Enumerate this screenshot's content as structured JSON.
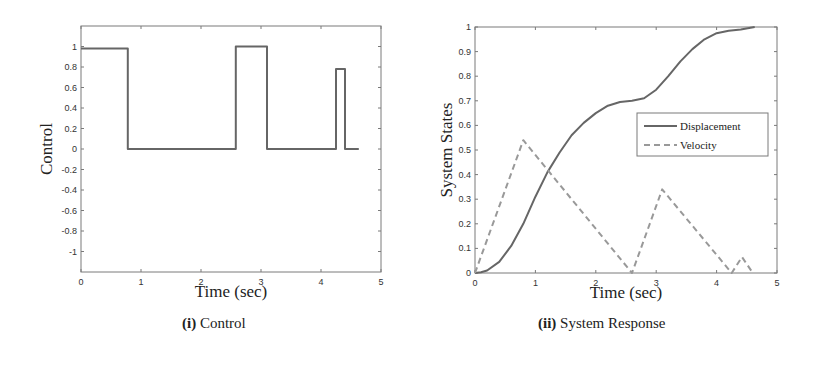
{
  "chart_data": [
    {
      "type": "line",
      "title": "",
      "caption_prefix": "(i)",
      "caption": "Control",
      "xlabel": "Time (sec)",
      "ylabel": "Control",
      "xlim": [
        0,
        5
      ],
      "ylim": [
        -1.2,
        1.2
      ],
      "xticks": [
        "0",
        "1",
        "2",
        "3",
        "4",
        "5"
      ],
      "yticks": [
        "1",
        "0.8",
        "0.6",
        "0.4",
        "0.2",
        "0",
        "-0.2",
        "-0.4",
        "-0.6",
        "-0.8",
        "-1"
      ],
      "grid": false,
      "series": [
        {
          "name": "Control",
          "style": "solid",
          "color": "#666666",
          "x": [
            0,
            0.78,
            0.78,
            2.58,
            2.58,
            3.1,
            3.1,
            4.25,
            4.25,
            4.4,
            4.4,
            4.63
          ],
          "y": [
            0.98,
            0.98,
            0,
            0,
            1.0,
            1.0,
            0,
            0,
            0.78,
            0.78,
            0,
            0
          ]
        }
      ]
    },
    {
      "type": "line",
      "title": "",
      "caption_prefix": "(ii)",
      "caption": "System Response",
      "xlabel": "Time (sec)",
      "ylabel": "System States",
      "xlim": [
        0,
        5
      ],
      "ylim": [
        0,
        1
      ],
      "xticks": [
        "0",
        "1",
        "2",
        "3",
        "4",
        "5"
      ],
      "yticks": [
        "1",
        "0.9",
        "0.8",
        "0.7",
        "0.6",
        "0.5",
        "0.4",
        "0.3",
        "0.2",
        "0.1",
        "0"
      ],
      "grid": false,
      "legend": {
        "position": "center-right",
        "entries": [
          "Displacement",
          "Velocity"
        ]
      },
      "series": [
        {
          "name": "Displacement",
          "style": "solid",
          "color": "#666666",
          "x": [
            0,
            0.1,
            0.2,
            0.4,
            0.6,
            0.8,
            1.0,
            1.2,
            1.4,
            1.6,
            1.8,
            2.0,
            2.2,
            2.4,
            2.6,
            2.8,
            3.0,
            3.2,
            3.4,
            3.6,
            3.8,
            4.0,
            4.2,
            4.4,
            4.63
          ],
          "y": [
            0,
            0.003,
            0.01,
            0.045,
            0.11,
            0.2,
            0.31,
            0.41,
            0.49,
            0.56,
            0.61,
            0.65,
            0.68,
            0.695,
            0.7,
            0.71,
            0.745,
            0.8,
            0.86,
            0.91,
            0.95,
            0.975,
            0.985,
            0.99,
            1.0
          ]
        },
        {
          "name": "Velocity",
          "style": "dashed",
          "color": "#999999",
          "x": [
            0,
            0.8,
            2.6,
            3.1,
            4.25,
            4.42,
            4.6
          ],
          "y": [
            0,
            0.54,
            0.0,
            0.34,
            0.0,
            0.065,
            0.0
          ]
        }
      ]
    }
  ]
}
